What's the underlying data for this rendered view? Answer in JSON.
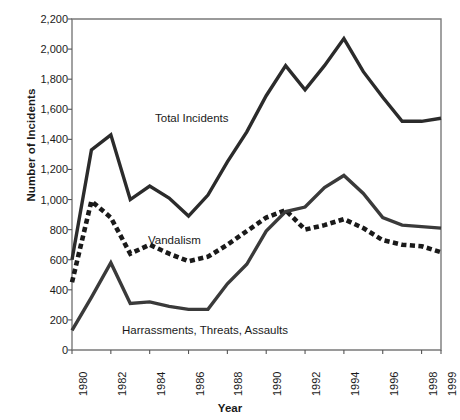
{
  "chart_data": {
    "type": "line",
    "title": "",
    "xlabel": "Year",
    "ylabel": "Number of Incidents",
    "xlim": [
      1980,
      1999
    ],
    "ylim": [
      0,
      2200
    ],
    "grid": false,
    "legend_position": "inline-labels",
    "x": [
      1980,
      1981,
      1982,
      1983,
      1984,
      1985,
      1986,
      1987,
      1988,
      1989,
      1990,
      1991,
      1992,
      1993,
      1994,
      1995,
      1996,
      1997,
      1998,
      1999
    ],
    "xtick_labels": [
      "1980",
      "1982",
      "1984",
      "1986",
      "1988",
      "1990",
      "1992",
      "1994",
      "1996",
      "1998",
      "1999"
    ],
    "xtick_values": [
      1980,
      1982,
      1984,
      1986,
      1988,
      1990,
      1992,
      1994,
      1996,
      1998,
      1999
    ],
    "ytick_labels": [
      "0",
      "200",
      "400",
      "600",
      "800",
      "1,000",
      "1,200",
      "1,400",
      "1,600",
      "1,800",
      "2,000",
      "2,200"
    ],
    "ytick_values": [
      0,
      200,
      400,
      600,
      800,
      1000,
      1200,
      1400,
      1600,
      1800,
      2000,
      2200
    ],
    "series": [
      {
        "name": "Total Incidents",
        "style": "solid",
        "color": "#2b2b2b",
        "values": [
          600,
          1330,
          1430,
          1000,
          1090,
          1010,
          890,
          1030,
          1250,
          1450,
          1690,
          1890,
          1730,
          1890,
          2070,
          1850,
          1680,
          1520,
          1520,
          1540
        ]
      },
      {
        "name": "Vandalism",
        "style": "dashed",
        "color": "#1a1a1a",
        "values": [
          450,
          990,
          880,
          640,
          700,
          640,
          590,
          620,
          700,
          790,
          880,
          930,
          800,
          830,
          870,
          810,
          730,
          700,
          690,
          650
        ]
      },
      {
        "name": "Harrassments, Threats, Assaults",
        "style": "solid",
        "color": "#3a3a3a",
        "values": [
          130,
          350,
          580,
          310,
          320,
          290,
          270,
          270,
          440,
          570,
          790,
          920,
          950,
          1080,
          1160,
          1040,
          880,
          830,
          820,
          810
        ]
      }
    ],
    "series_labels": [
      {
        "text": "Total Incidents",
        "x_px": 155,
        "y_px": 112
      },
      {
        "text": "Vandalism",
        "x_px": 148,
        "y_px": 234
      },
      {
        "text": "Harrassments, Threats, Assaults",
        "x_px": 122,
        "y_px": 324
      }
    ]
  }
}
